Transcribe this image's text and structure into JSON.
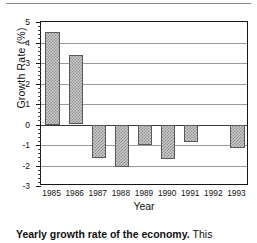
{
  "chart_data": {
    "type": "bar",
    "title": "",
    "xlabel": "Year",
    "ylabel": "Growth Rate (%)",
    "categories": [
      "1985",
      "1986",
      "1987",
      "1988",
      "1989",
      "1990",
      "1991",
      "1992",
      "1993"
    ],
    "values": [
      4.5,
      3.4,
      -1.65,
      -2.05,
      -1.0,
      -1.7,
      -0.85,
      0,
      -1.15
    ],
    "ylim": [
      -3,
      5
    ],
    "ytick_labels": [
      "5",
      "4",
      "3",
      "2",
      "1",
      "0",
      "-1",
      "-2",
      "-3"
    ],
    "ytick_values": [
      5,
      4,
      3,
      2,
      1,
      0,
      -1,
      -2,
      -3
    ],
    "grid": true,
    "legend": "none",
    "series": [
      {
        "name": "Growth Rate (%)",
        "values": [
          4.5,
          3.4,
          -1.65,
          -2.05,
          -1.0,
          -1.7,
          -0.85,
          0,
          -1.15
        ]
      }
    ]
  },
  "caption": {
    "lead": "Yearly growth rate of the economy.",
    "tail": "This"
  }
}
